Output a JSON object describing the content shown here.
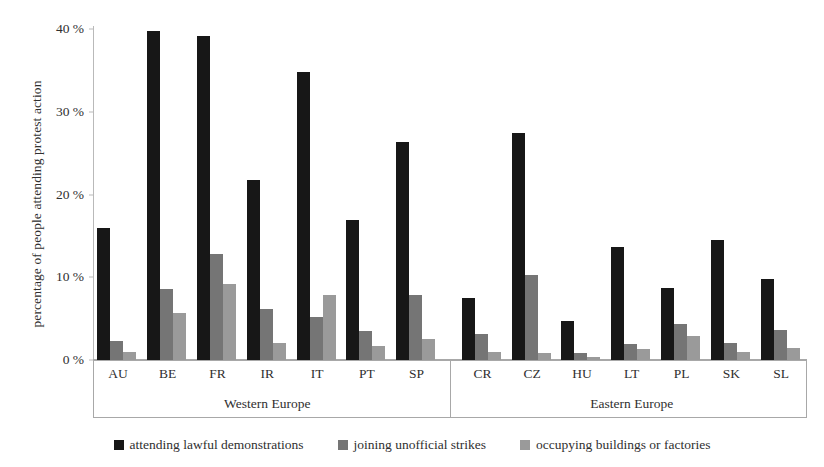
{
  "chart_data": {
    "type": "bar",
    "title": "",
    "xlabel": "",
    "ylabel": "percentage of people attending protest action",
    "ylim": [
      0,
      40
    ],
    "yticks": [
      0,
      10,
      20,
      30,
      40
    ],
    "ytick_labels": [
      "0 %",
      "10 %",
      "20 %",
      "30 %",
      "40 %"
    ],
    "grid": false,
    "legend_position": "bottom",
    "categories": [
      "AU",
      "BE",
      "FR",
      "IR",
      "IT",
      "PT",
      "SP",
      "CR",
      "CZ",
      "HU",
      "LT",
      "PL",
      "SK",
      "SL"
    ],
    "groups": [
      {
        "label": "Western Europe",
        "categories": [
          "AU",
          "BE",
          "FR",
          "IR",
          "IT",
          "PT",
          "SP"
        ]
      },
      {
        "label": "Eastern Europe",
        "categories": [
          "CR",
          "CZ",
          "HU",
          "LT",
          "PL",
          "SK",
          "SL"
        ]
      }
    ],
    "series": [
      {
        "name": "attending lawful demonstrations",
        "color": "#171717",
        "values": [
          16.0,
          39.7,
          39.2,
          21.8,
          34.8,
          16.9,
          26.3,
          7.5,
          27.4,
          4.7,
          13.7,
          8.7,
          14.5,
          9.8
        ]
      },
      {
        "name": "joining unofficial strikes",
        "color": "#757575",
        "values": [
          2.3,
          8.6,
          12.8,
          6.2,
          5.2,
          3.5,
          7.9,
          3.1,
          10.3,
          0.9,
          1.9,
          4.4,
          2.1,
          3.6
        ]
      },
      {
        "name": "occupying buildings or factories",
        "color": "#9a9a9a",
        "values": [
          1.0,
          5.7,
          9.2,
          2.0,
          7.9,
          1.7,
          2.6,
          1.0,
          0.8,
          0.4,
          1.3,
          2.9,
          1.0,
          1.5
        ]
      }
    ]
  },
  "legend": {
    "items": [
      {
        "label": "attending lawful demonstrations",
        "color": "#171717",
        "swatch_name": "legend-swatch-demonstrations"
      },
      {
        "label": "joining unofficial strikes",
        "color": "#757575",
        "swatch_name": "legend-swatch-strikes"
      },
      {
        "label": "occupying buildings or factories",
        "color": "#9a9a9a",
        "swatch_name": "legend-swatch-occupying"
      }
    ]
  }
}
